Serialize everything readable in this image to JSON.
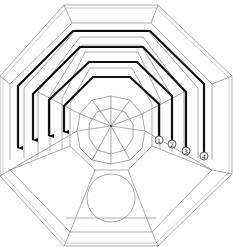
{
  "diagram": {
    "colors": {
      "background": "#ffffff",
      "thin_lines": "#8a8a8a",
      "thick_paths": "#111111"
    },
    "paths": [
      {
        "id": 1,
        "label": "1"
      },
      {
        "id": 2,
        "label": "2"
      },
      {
        "id": 3,
        "label": "3"
      },
      {
        "id": 4,
        "label": "4"
      }
    ],
    "elements": {
      "outer_frame": "octagon",
      "center_feature": "spider-web",
      "floor_feature": "circle",
      "arrow_direction": "down"
    }
  }
}
